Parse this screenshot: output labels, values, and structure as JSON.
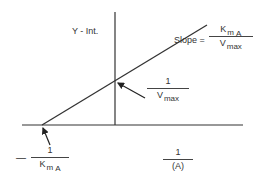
{
  "diagram": {
    "type": "lineweaver-burk-plot",
    "y_axis_label": "Y - Int.",
    "x_axis_label": {
      "numerator": "1",
      "denominator": "(A)"
    },
    "slope_label": {
      "prefix": "Slope =",
      "numerator_main": "K",
      "numerator_sub": "m",
      "numerator_sub2": "A",
      "denominator_main": "V",
      "denominator_sub": "max"
    },
    "y_intercept_label": {
      "numerator": "1",
      "denominator_main": "V",
      "denominator_sub": "max"
    },
    "x_intercept_label": {
      "sign": "—",
      "numerator": "1",
      "denominator_main": "K",
      "denominator_sub": "m",
      "denominator_sub2": "A"
    },
    "colors": {
      "line": "#333333",
      "background": "#ffffff"
    }
  }
}
